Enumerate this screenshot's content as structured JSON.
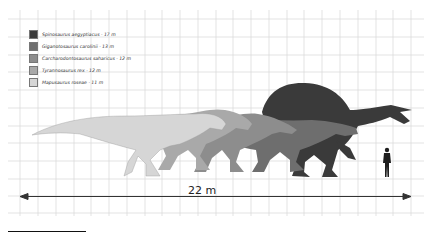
{
  "diagram": {
    "legend": [
      {
        "label": "Spinosaurus aegyptiacus · 17 m",
        "color": "#3a3a3a"
      },
      {
        "label": "Giganotosaurus carolinii · 13 m",
        "color": "#6e6e6e"
      },
      {
        "label": "Carcharodontosaurus saharicus · 12 m",
        "color": "#8d8d8d"
      },
      {
        "label": "Tyrannosaurus rex · 12 m",
        "color": "#a9a9a9"
      },
      {
        "label": "Mapusaurus roseae · 11 m",
        "color": "#d6d6d6"
      }
    ],
    "scale_bar": {
      "label": "22 m"
    },
    "human_figure": "human-silhouette",
    "colors": {
      "grid": "#d8d8d8",
      "background": "#ffffff",
      "arrow": "#333333"
    }
  }
}
